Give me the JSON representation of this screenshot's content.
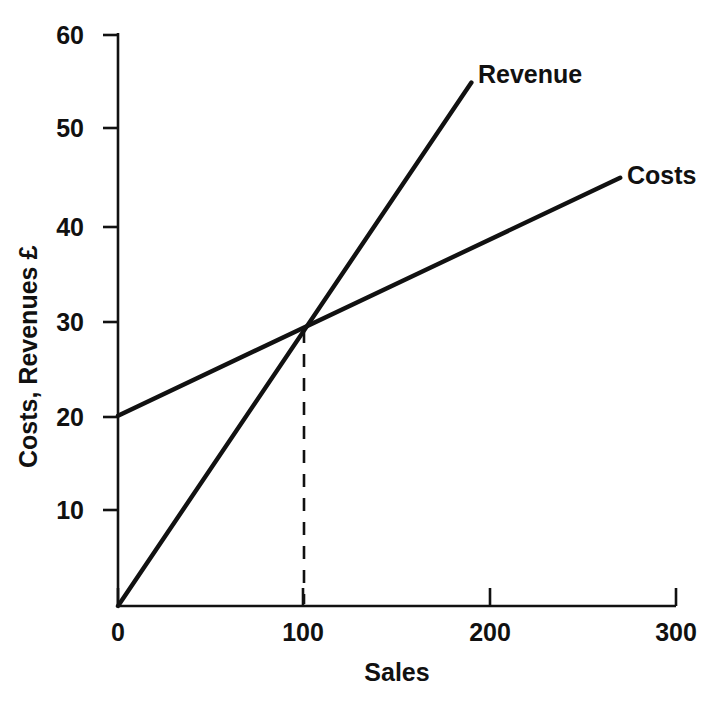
{
  "chart_data": {
    "type": "line",
    "title": "",
    "xlabel": "Sales",
    "ylabel": "Costs, Revenues £",
    "xlim": [
      0,
      300
    ],
    "ylim": [
      0,
      60
    ],
    "xticks": [
      "0",
      "100",
      "200",
      "300"
    ],
    "xtick_values": [
      0,
      100,
      200,
      300
    ],
    "yticks": [
      "10",
      "20",
      "30",
      "40",
      "50",
      "60"
    ],
    "ytick_values": [
      10,
      20,
      30,
      40,
      50,
      60
    ],
    "grid": false,
    "legend_position": "inline-at-line-ends",
    "series": [
      {
        "name": "Revenue",
        "label": "Revenue",
        "color": "#111111",
        "x": [
          0,
          190
        ],
        "values": [
          0,
          55
        ]
      },
      {
        "name": "Costs",
        "label": "Costs",
        "color": "#111111",
        "x": [
          0,
          270
        ],
        "values": [
          20,
          45
        ]
      }
    ],
    "annotations": [
      {
        "name": "break-even-dropline",
        "type": "dashed-vertical",
        "x": 100,
        "y_from": 0,
        "y_to": 29,
        "color": "#111111"
      }
    ],
    "breakeven": {
      "sales": 100,
      "value": 29
    }
  },
  "axis": {
    "y_title": "Costs, Revenues £",
    "x_title": "Sales",
    "y_ticks": [
      {
        "label": "60",
        "value": 60
      },
      {
        "label": "50",
        "value": 50
      },
      {
        "label": "40",
        "value": 40
      },
      {
        "label": "30",
        "value": 30
      },
      {
        "label": "20",
        "value": 20
      },
      {
        "label": "10",
        "value": 10
      }
    ],
    "x_ticks": [
      {
        "label": "0",
        "value": 0
      },
      {
        "label": "100",
        "value": 100
      },
      {
        "label": "200",
        "value": 200
      },
      {
        "label": "300",
        "value": 300
      }
    ]
  },
  "labels": {
    "revenue": "Revenue",
    "costs": "Costs"
  },
  "colors": {
    "ink": "#111111",
    "background": "#ffffff"
  }
}
